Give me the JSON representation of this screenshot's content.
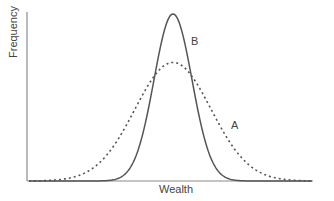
{
  "chart_data": {
    "type": "line",
    "title": "",
    "xlabel": "Wealth",
    "ylabel": "Frequency",
    "grid": false,
    "legend": "none (curves labeled directly)",
    "x_ticks": [],
    "y_ticks": [],
    "series": [
      {
        "name": "A",
        "style": "dotted",
        "description": "Wider, flatter bell curve (higher variance), same mean as B",
        "mean": 0,
        "relative_peak_height": 0.71,
        "relative_spread": 2.0,
        "color": "#555555"
      },
      {
        "name": "B",
        "style": "solid",
        "description": "Narrower, taller bell curve (lower variance), same mean as A",
        "mean": 0,
        "relative_peak_height": 1.0,
        "relative_spread": 1.0,
        "color": "#555555"
      }
    ],
    "annotations": [
      {
        "text": "A",
        "near": "right tail of dotted curve"
      },
      {
        "text": "B",
        "near": "right shoulder of solid curve"
      }
    ]
  },
  "labels": {
    "x_axis": "Wealth",
    "y_axis": "Frequency",
    "curve_a": "A",
    "curve_b": "B"
  },
  "colors": {
    "axis": "#888888",
    "curve": "#555555",
    "text": "#444444"
  }
}
